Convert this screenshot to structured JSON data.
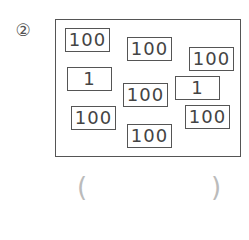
{
  "problem": {
    "number_label": "②",
    "cards": [
      {
        "value": "100",
        "x": 65,
        "y": 28
      },
      {
        "value": "100",
        "x": 127,
        "y": 37
      },
      {
        "value": "100",
        "x": 189,
        "y": 47
      },
      {
        "value": "1",
        "x": 67,
        "y": 67
      },
      {
        "value": "100",
        "x": 123,
        "y": 83
      },
      {
        "value": "1",
        "x": 175,
        "y": 76
      },
      {
        "value": "100",
        "x": 71,
        "y": 106
      },
      {
        "value": "100",
        "x": 185,
        "y": 105
      },
      {
        "value": "100",
        "x": 127,
        "y": 124
      }
    ],
    "answer": {
      "open_paren": "(",
      "close_paren": ")",
      "value": ""
    }
  }
}
